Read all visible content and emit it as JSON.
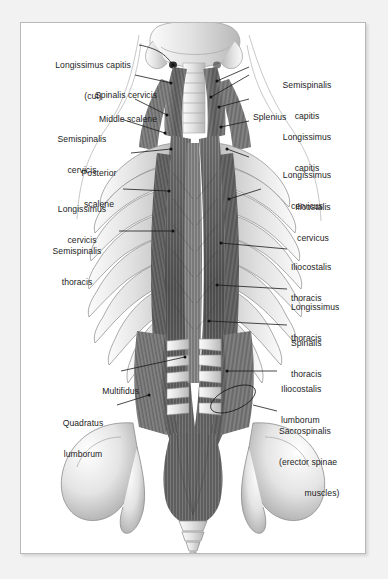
{
  "figure": {
    "view": "posterior",
    "panel_background": "#ffffff",
    "page_background": "#f2f2f2",
    "border_color": "#b9b9b9",
    "label_color": "#1d1d1d",
    "leader_color": "#1a1a1a",
    "muscle_color": "#6f6f6f",
    "bone_color": "#dcdcdc"
  },
  "labels_left": [
    {
      "id": "longissimus-capitis-cut",
      "line1": "Longissimus capitis",
      "line2": "(cut)",
      "x": 8,
      "y": 16,
      "w": 128,
      "align": "center"
    },
    {
      "id": "spinalis-cervicis",
      "line1": "Spinalis cervicis",
      "line2": "",
      "x": 28,
      "y": 46,
      "w": 108,
      "align": "right"
    },
    {
      "id": "middle-scalene",
      "line1": "Middle scalene",
      "line2": "",
      "x": 28,
      "y": 70,
      "w": 108,
      "align": "right"
    },
    {
      "id": "semispinalis-cervicis",
      "line1": "Semispinalis",
      "line2": "cervicis",
      "x": 6,
      "y": 90,
      "w": 110,
      "align": "center"
    },
    {
      "id": "posterior-scalene",
      "line1": "Posterior",
      "line2": "scalene",
      "x": 30,
      "y": 124,
      "w": 96,
      "align": "center"
    },
    {
      "id": "longissimus-cervicis",
      "line1": "Longissimus",
      "line2": "cervicis",
      "x": 6,
      "y": 160,
      "w": 110,
      "align": "center"
    },
    {
      "id": "semispinalis-thoracis",
      "line1": "Semispinalis",
      "line2": "thoracis",
      "x": 0,
      "y": 202,
      "w": 112,
      "align": "center"
    },
    {
      "id": "multifidus",
      "line1": "Multifidus",
      "line2": "",
      "x": 20,
      "y": 342,
      "w": 98,
      "align": "right"
    },
    {
      "id": "quadratus-lumborum",
      "line1": "Quadratus",
      "line2": "lumborum",
      "x": 14,
      "y": 374,
      "w": 96,
      "align": "center"
    }
  ],
  "labels_right": [
    {
      "id": "semispinalis-capitis",
      "line1": "Semispinalis",
      "line2": "capitis",
      "x": 252,
      "y": 36,
      "w": 112,
      "align": "center"
    },
    {
      "id": "splenius",
      "line1": "Splenius",
      "line2": "",
      "x": 252,
      "y": 68,
      "w": 112,
      "align": "left"
    },
    {
      "id": "longissimus-capitis",
      "line1": "Longissimus",
      "line2": "capitis",
      "x": 252,
      "y": 88,
      "w": 112,
      "align": "center"
    },
    {
      "id": "longissimus-cervicus",
      "line1": "Longissimus",
      "line2": "cervicus",
      "x": 252,
      "y": 126,
      "w": 112,
      "align": "center"
    },
    {
      "id": "ilicostalis-cervicus",
      "line1": "Ilicostalis",
      "line2": "cervicus",
      "x": 262,
      "y": 158,
      "w": 110,
      "align": "center"
    },
    {
      "id": "iliocostalis-thoracis",
      "line1": "Iliocostalis",
      "line2": "thoracis",
      "x": 288,
      "y": 218,
      "w": 100,
      "align": "left"
    },
    {
      "id": "longissimus-thoracis",
      "line1": "Longissimus",
      "line2": "thoracis",
      "x": 288,
      "y": 258,
      "w": 100,
      "align": "left"
    },
    {
      "id": "spinalis-thoracis",
      "line1": "Spinalis",
      "line2": "thoracis",
      "x": 288,
      "y": 294,
      "w": 100,
      "align": "left"
    },
    {
      "id": "iliocostalis-lumborum",
      "line1": "Iliocostalis",
      "line2": "lumborum",
      "x": 278,
      "y": 340,
      "w": 106,
      "align": "left"
    },
    {
      "id": "sacrospinalis",
      "line1": "Sacrospinalis",
      "line2": "(erector spinae",
      "line3": "muscles)",
      "x": 276,
      "y": 382,
      "w": 110,
      "align": "left"
    }
  ],
  "anatomy_parts": [
    "occiput-skull-base",
    "cervical-vertebrae",
    "thoracic-rib-cage",
    "lumbar-vertebrae",
    "sacrum",
    "coccyx",
    "iliac-crest-left",
    "iliac-crest-right",
    "erector-spinae-column",
    "body-outline-contour"
  ]
}
